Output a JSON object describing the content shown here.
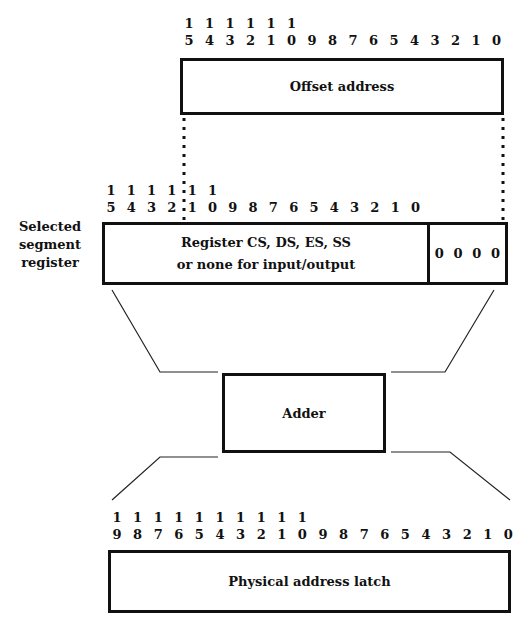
{
  "diagram": {
    "offset": {
      "label": "Offset address",
      "bits_top": [
        "1",
        "1",
        "1",
        "1",
        "1",
        "1",
        "",
        "",
        "",
        "",
        "",
        "",
        "",
        "",
        "",
        ""
      ],
      "bits_bottom": [
        "5",
        "4",
        "3",
        "2",
        "1",
        "0",
        "9",
        "8",
        "7",
        "6",
        "5",
        "4",
        "3",
        "2",
        "1",
        "0"
      ]
    },
    "segment": {
      "side_label": [
        "Selected",
        "segment",
        "register"
      ],
      "line1": "Register CS, DS, ES, SS",
      "line2": "or none for input/output",
      "zeros": [
        "0",
        "0",
        "0",
        "0"
      ],
      "bits_top": [
        "1",
        "1",
        "1",
        "1",
        "1",
        "1",
        "",
        "",
        "",
        "",
        "",
        "",
        "",
        "",
        "",
        ""
      ],
      "bits_bottom": [
        "5",
        "4",
        "3",
        "2",
        "1",
        "0",
        "9",
        "8",
        "7",
        "6",
        "5",
        "4",
        "3",
        "2",
        "1",
        "0"
      ]
    },
    "adder": {
      "label": "Adder"
    },
    "physical": {
      "label": "Physical address latch",
      "bits_top": [
        "1",
        "1",
        "1",
        "1",
        "1",
        "1",
        "1",
        "1",
        "1",
        "1",
        "",
        "",
        "",
        "",
        "",
        "",
        "",
        "",
        "",
        ""
      ],
      "bits_bottom": [
        "9",
        "8",
        "7",
        "6",
        "5",
        "4",
        "3",
        "2",
        "1",
        "0",
        "9",
        "8",
        "7",
        "6",
        "5",
        "4",
        "3",
        "2",
        "1",
        "0"
      ]
    }
  }
}
